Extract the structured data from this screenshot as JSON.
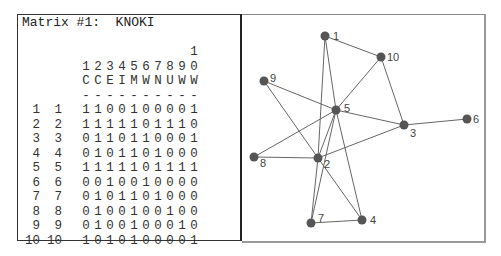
{
  "matrix": {
    "title": "Matrix #1:  KNOKI",
    "columns": [
      {
        "index_top": "",
        "index": "1",
        "code": "C"
      },
      {
        "index_top": "",
        "index": "2",
        "code": "C"
      },
      {
        "index_top": "",
        "index": "3",
        "code": "E"
      },
      {
        "index_top": "",
        "index": "4",
        "code": "I"
      },
      {
        "index_top": "",
        "index": "5",
        "code": "M"
      },
      {
        "index_top": "",
        "index": "6",
        "code": "W"
      },
      {
        "index_top": "",
        "index": "7",
        "code": "N"
      },
      {
        "index_top": "",
        "index": "8",
        "code": "U"
      },
      {
        "index_top": "",
        "index": "9",
        "code": "W"
      },
      {
        "index_top": "1",
        "index": "0",
        "code": "W"
      }
    ],
    "dash": "-",
    "rows": [
      {
        "id": "1",
        "label": "1",
        "values": [
          "1",
          "1",
          "0",
          "0",
          "1",
          "0",
          "0",
          "0",
          "0",
          "1"
        ]
      },
      {
        "id": "2",
        "label": "2",
        "values": [
          "1",
          "1",
          "1",
          "1",
          "1",
          "0",
          "1",
          "1",
          "1",
          "0"
        ]
      },
      {
        "id": "3",
        "label": "3",
        "values": [
          "0",
          "1",
          "1",
          "0",
          "1",
          "1",
          "0",
          "0",
          "0",
          "1"
        ]
      },
      {
        "id": "4",
        "label": "4",
        "values": [
          "0",
          "1",
          "0",
          "1",
          "1",
          "0",
          "1",
          "0",
          "0",
          "0"
        ]
      },
      {
        "id": "5",
        "label": "5",
        "values": [
          "1",
          "1",
          "1",
          "1",
          "1",
          "0",
          "1",
          "1",
          "1",
          "1"
        ]
      },
      {
        "id": "6",
        "label": "6",
        "values": [
          "0",
          "0",
          "1",
          "0",
          "0",
          "1",
          "0",
          "0",
          "0",
          "0"
        ]
      },
      {
        "id": "7",
        "label": "7",
        "values": [
          "0",
          "1",
          "0",
          "1",
          "1",
          "0",
          "1",
          "0",
          "0",
          "0"
        ]
      },
      {
        "id": "8",
        "label": "8",
        "values": [
          "0",
          "1",
          "0",
          "0",
          "1",
          "0",
          "0",
          "1",
          "0",
          "0"
        ]
      },
      {
        "id": "9",
        "label": "9",
        "values": [
          "0",
          "1",
          "0",
          "0",
          "1",
          "0",
          "0",
          "0",
          "1",
          "0"
        ]
      },
      {
        "id": "10",
        "label": "10",
        "values": [
          "1",
          "0",
          "1",
          "0",
          "1",
          "0",
          "0",
          "0",
          "0",
          "1"
        ]
      }
    ]
  },
  "graph": {
    "node_color": "#555555",
    "edge_color": "#666666",
    "nodes": [
      {
        "id": "1",
        "label": "1",
        "x": 83,
        "y": 21,
        "lx": 8,
        "ly": 0
      },
      {
        "id": "2",
        "label": "2",
        "x": 76,
        "y": 143,
        "lx": 6,
        "ly": 6
      },
      {
        "id": "3",
        "label": "3",
        "x": 162,
        "y": 110,
        "lx": 6,
        "ly": 8
      },
      {
        "id": "4",
        "label": "4",
        "x": 120,
        "y": 205,
        "lx": 8,
        "ly": 0
      },
      {
        "id": "5",
        "label": "5",
        "x": 94,
        "y": 95,
        "lx": 8,
        "ly": -2
      },
      {
        "id": "6",
        "label": "6",
        "x": 225,
        "y": 104,
        "lx": 6,
        "ly": 0
      },
      {
        "id": "7",
        "label": "7",
        "x": 69,
        "y": 208,
        "lx": 7,
        "ly": -5
      },
      {
        "id": "8",
        "label": "8",
        "x": 12,
        "y": 142,
        "lx": 6,
        "ly": 6
      },
      {
        "id": "9",
        "label": "9",
        "x": 22,
        "y": 66,
        "lx": 6,
        "ly": -3
      },
      {
        "id": "10",
        "label": "10",
        "x": 139,
        "y": 42,
        "lx": 6,
        "ly": 0
      }
    ],
    "edges": [
      [
        "1",
        "2"
      ],
      [
        "1",
        "5"
      ],
      [
        "1",
        "10"
      ],
      [
        "2",
        "3"
      ],
      [
        "2",
        "4"
      ],
      [
        "2",
        "5"
      ],
      [
        "2",
        "7"
      ],
      [
        "2",
        "8"
      ],
      [
        "2",
        "9"
      ],
      [
        "3",
        "5"
      ],
      [
        "3",
        "6"
      ],
      [
        "3",
        "10"
      ],
      [
        "4",
        "5"
      ],
      [
        "4",
        "7"
      ],
      [
        "5",
        "7"
      ],
      [
        "5",
        "8"
      ],
      [
        "5",
        "9"
      ],
      [
        "5",
        "10"
      ]
    ]
  }
}
